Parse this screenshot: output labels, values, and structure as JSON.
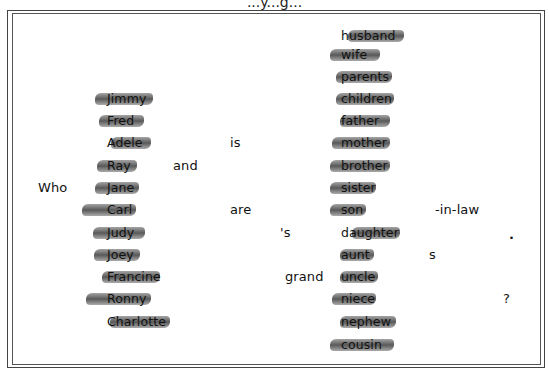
{
  "page": {
    "top_cut_text": "...y...g..."
  },
  "sentence_parts": {
    "who": "Who",
    "and": "and",
    "is": "is",
    "are": "are",
    "possessive": "'s",
    "grand": "grand",
    "in_law": "-in-law",
    "plural_s": "s",
    "period": ".",
    "question_mark": "?"
  },
  "names": [
    {
      "label": "Jimmy",
      "x": 107,
      "y": 99,
      "hl_x": 95,
      "hl_w": 58
    },
    {
      "label": "Fred",
      "x": 107,
      "y": 121,
      "hl_x": 99,
      "hl_w": 45
    },
    {
      "label": "Adele",
      "x": 107,
      "y": 143,
      "hl_x": 111,
      "hl_w": 40
    },
    {
      "label": "Ray",
      "x": 107,
      "y": 166,
      "hl_x": 97,
      "hl_w": 40
    },
    {
      "label": "Jane",
      "x": 107,
      "y": 188,
      "hl_x": 95,
      "hl_w": 44
    },
    {
      "label": "Carl",
      "x": 107,
      "y": 210,
      "hl_x": 82,
      "hl_w": 54
    },
    {
      "label": "Judy",
      "x": 107,
      "y": 233,
      "hl_x": 93,
      "hl_w": 52
    },
    {
      "label": "Joey",
      "x": 107,
      "y": 255,
      "hl_x": 94,
      "hl_w": 46
    },
    {
      "label": "Francine",
      "x": 107,
      "y": 277,
      "hl_x": 102,
      "hl_w": 58
    },
    {
      "label": "Ronny",
      "x": 107,
      "y": 299,
      "hl_x": 86,
      "hl_w": 65
    },
    {
      "label": "Charlotte",
      "x": 107,
      "y": 322,
      "hl_x": 110,
      "hl_w": 60
    }
  ],
  "relations": [
    {
      "label": "husband",
      "x": 341,
      "y": 36,
      "hl_x": 348,
      "hl_w": 56
    },
    {
      "label": "wife",
      "x": 341,
      "y": 55,
      "hl_x": 330,
      "hl_w": 50
    },
    {
      "label": "parents",
      "x": 341,
      "y": 77,
      "hl_x": 336,
      "hl_w": 56
    },
    {
      "label": "children",
      "x": 341,
      "y": 99,
      "hl_x": 336,
      "hl_w": 58
    },
    {
      "label": "father",
      "x": 341,
      "y": 121,
      "hl_x": 340,
      "hl_w": 50
    },
    {
      "label": "mother",
      "x": 341,
      "y": 143,
      "hl_x": 332,
      "hl_w": 58
    },
    {
      "label": "brother",
      "x": 341,
      "y": 166,
      "hl_x": 330,
      "hl_w": 60
    },
    {
      "label": "sister",
      "x": 341,
      "y": 188,
      "hl_x": 330,
      "hl_w": 46
    },
    {
      "label": "son",
      "x": 341,
      "y": 210,
      "hl_x": 330,
      "hl_w": 36
    },
    {
      "label": "daughter",
      "x": 341,
      "y": 233,
      "hl_x": 352,
      "hl_w": 48
    },
    {
      "label": "aunt",
      "x": 341,
      "y": 255,
      "hl_x": 340,
      "hl_w": 34
    },
    {
      "label": "uncle",
      "x": 341,
      "y": 277,
      "hl_x": 340,
      "hl_w": 38
    },
    {
      "label": "niece",
      "x": 341,
      "y": 299,
      "hl_x": 332,
      "hl_w": 44
    },
    {
      "label": "nephew",
      "x": 341,
      "y": 322,
      "hl_x": 340,
      "hl_w": 56
    },
    {
      "label": "cousin",
      "x": 341,
      "y": 345,
      "hl_x": 330,
      "hl_w": 64
    }
  ]
}
